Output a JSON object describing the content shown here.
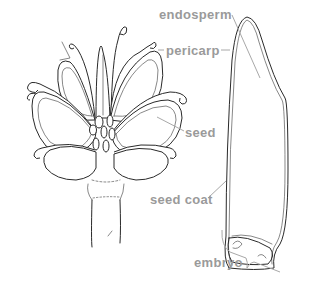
{
  "figure": {
    "type": "botanical-illustration",
    "left_drawing": "seed head with radiating seeds on stalk",
    "right_drawing": "longitudinal section of a single seed"
  },
  "labels": {
    "endosperm": "endosperm",
    "pericarp": "pericarp",
    "seed": "seed",
    "seed_coat": "seed coat",
    "embryo": "embryo"
  },
  "colors": {
    "label_text": "#9a9a9a",
    "leader_line": "#a8a8a8",
    "ink": "#2a2a2a",
    "background": "#ffffff"
  }
}
